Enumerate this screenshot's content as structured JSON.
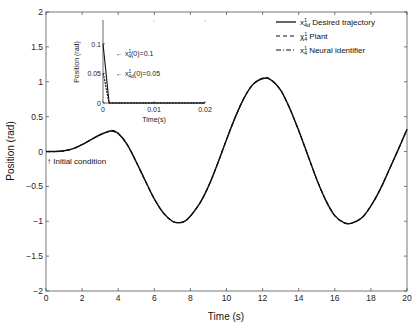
{
  "chart_data": [
    {
      "type": "line",
      "title": "",
      "xlabel": "Time (s)",
      "ylabel": "Position (rad)",
      "xlim": [
        0,
        20
      ],
      "ylim": [
        -2,
        2
      ],
      "xticks": [
        "0",
        "2",
        "4",
        "6",
        "8",
        "10",
        "12",
        "14",
        "16",
        "18",
        "20"
      ],
      "yticks": [
        "2",
        "1.5",
        "1",
        "0.5",
        "0",
        "-0.5",
        "-1",
        "-1.5",
        "-2"
      ],
      "grid": false,
      "legend_position": "upper right",
      "annotation": "↑ Initial condition",
      "x": [
        0,
        0.5,
        1,
        1.5,
        2,
        2.5,
        3,
        3.5,
        3.7,
        4,
        4.5,
        5,
        5.5,
        6,
        6.5,
        7,
        7.4,
        7.8,
        8.5,
        9,
        9.5,
        10,
        10.5,
        11,
        11.5,
        12.1,
        12.5,
        13,
        13.5,
        14,
        14.5,
        15,
        15.5,
        16,
        16.5,
        16.9,
        17.5,
        18,
        18.5,
        19,
        19.5,
        20
      ],
      "series": [
        {
          "name": "x¹₄d Desired trajectory",
          "style": "solid",
          "values": [
            0,
            0.0,
            0.01,
            0.04,
            0.1,
            0.17,
            0.24,
            0.29,
            0.29,
            0.26,
            0.1,
            -0.15,
            -0.42,
            -0.68,
            -0.88,
            -1.0,
            -1.02,
            -0.98,
            -0.75,
            -0.5,
            -0.18,
            0.17,
            0.5,
            0.78,
            0.97,
            1.05,
            1.02,
            0.88,
            0.62,
            0.3,
            -0.05,
            -0.4,
            -0.7,
            -0.92,
            -1.02,
            -1.03,
            -0.95,
            -0.78,
            -0.55,
            -0.27,
            0.02,
            0.32
          ]
        },
        {
          "name": "χ¹₄ Plant",
          "style": "dashed",
          "values": [
            0,
            0.0,
            0.01,
            0.04,
            0.1,
            0.17,
            0.24,
            0.29,
            0.3,
            0.26,
            0.1,
            -0.15,
            -0.42,
            -0.68,
            -0.88,
            -1.0,
            -1.02,
            -0.98,
            -0.75,
            -0.5,
            -0.18,
            0.17,
            0.5,
            0.78,
            0.97,
            1.06,
            1.02,
            0.88,
            0.62,
            0.3,
            -0.05,
            -0.4,
            -0.7,
            -0.92,
            -1.02,
            -1.03,
            -0.95,
            -0.78,
            -0.55,
            -0.27,
            0.02,
            0.32
          ]
        },
        {
          "name": "x¹₄ Neural identifier",
          "style": "dashdot",
          "values": [
            0,
            0.0,
            0.01,
            0.04,
            0.1,
            0.17,
            0.24,
            0.29,
            0.29,
            0.26,
            0.1,
            -0.15,
            -0.42,
            -0.68,
            -0.88,
            -1.0,
            -1.02,
            -0.98,
            -0.75,
            -0.5,
            -0.18,
            0.17,
            0.5,
            0.78,
            0.97,
            1.05,
            1.02,
            0.88,
            0.62,
            0.3,
            -0.05,
            -0.4,
            -0.7,
            -0.92,
            -1.02,
            -1.03,
            -0.95,
            -0.78,
            -0.55,
            -0.27,
            0.02,
            0.32
          ]
        }
      ]
    },
    {
      "type": "line",
      "title": "inset",
      "xlabel": "Time(s)",
      "ylabel": "Position (rad)",
      "xlim": [
        0,
        0.02
      ],
      "ylim": [
        0,
        0.14
      ],
      "xticks": [
        "0",
        "0.01",
        "0.02"
      ],
      "yticks": [
        "0.1",
        "0.05",
        "0"
      ],
      "annotations": [
        "← x¹₄(0)=0.1",
        "← x¹₄d(0)=0.05"
      ],
      "x": [
        0,
        0.0003,
        0.0006,
        0.0009,
        0.0012,
        0.02
      ],
      "series": [
        {
          "name": "plant",
          "values": [
            0.1,
            0.075,
            0.05,
            0.025,
            0.0,
            0.0
          ]
        },
        {
          "name": "desired",
          "values": [
            0.05,
            0.04,
            0.025,
            0.012,
            0.0,
            0.0
          ]
        }
      ]
    }
  ],
  "legend": {
    "items": [
      {
        "sym": "x",
        "sup": "1",
        "sub": "4d",
        "label": "Desired trajectory"
      },
      {
        "sym": "χ",
        "sup": "1",
        "sub": "4",
        "label": "Plant"
      },
      {
        "sym": "x",
        "sup": "1",
        "sub": "4",
        "label": "Neural identifier"
      }
    ]
  },
  "labels": {
    "xlabel": "Time (s)",
    "ylabel": "Position (rad)",
    "initial_condition": "↑ Initial condition",
    "inset_xlabel": "Time(s)",
    "inset_ylabel": "Position (rad)",
    "inset_ann1_prefix": "← x",
    "inset_ann1_sup": "1",
    "inset_ann1_sub": "4",
    "inset_ann1_suffix": "(0)=0.1",
    "inset_ann2_prefix": "← x",
    "inset_ann2_sup": "1",
    "inset_ann2_sub": "4d",
    "inset_ann2_suffix": "(0)=0.05"
  }
}
